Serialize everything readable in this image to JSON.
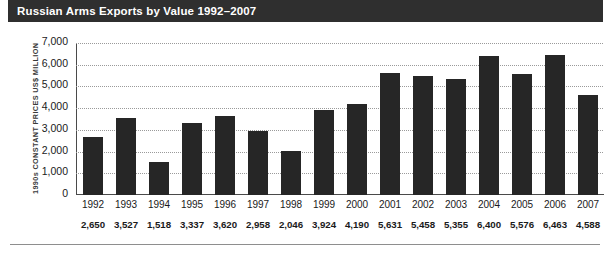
{
  "header": {
    "title": "Russian Arms Exports by Value 1992–2007",
    "background_color": "#2f2f2f",
    "text_color": "#ffffff"
  },
  "chart_data": {
    "type": "bar",
    "title": "Russian Arms Exports by Value 1992–2007",
    "xlabel": "",
    "ylabel": "1990s CONSTANT PRICES US$ MILLION",
    "ylim": [
      0,
      7000
    ],
    "ytick_labels": [
      "7,000",
      "6,000",
      "5,000",
      "4,000",
      "3,000",
      "2,000",
      "1,000",
      "0"
    ],
    "ytick_values": [
      7000,
      6000,
      5000,
      4000,
      3000,
      2000,
      1000,
      0
    ],
    "grid": true,
    "legend": "none",
    "bar_color": "#262626",
    "categories": [
      "1992",
      "1993",
      "1994",
      "1995",
      "1996",
      "1997",
      "1998",
      "1999",
      "2000",
      "2001",
      "2002",
      "2003",
      "2004",
      "2005",
      "2006",
      "2007"
    ],
    "values": [
      2650,
      3527,
      1518,
      3337,
      3620,
      2958,
      2046,
      3924,
      4190,
      5631,
      5458,
      5355,
      6400,
      5576,
      6463,
      4588
    ],
    "value_labels": [
      "2,650",
      "3,527",
      "1,518",
      "3,337",
      "3,620",
      "2,958",
      "2,046",
      "3,924",
      "4,190",
      "5,631",
      "5,458",
      "5,355",
      "6,400",
      "5,576",
      "6,463",
      "4,588"
    ]
  }
}
